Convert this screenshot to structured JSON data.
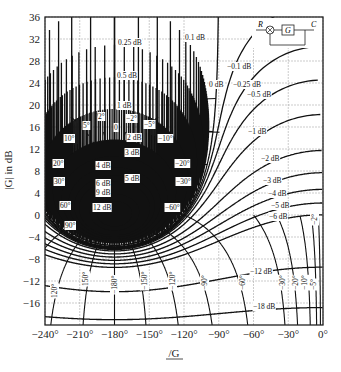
{
  "chart_data": {
    "type": "line",
    "xlabel": "/G",
    "ylabel": "|G| in dB",
    "xlim": [
      -240,
      0
    ],
    "ylim": [
      -20,
      36
    ],
    "x_ticks": [
      -240,
      -210,
      -180,
      -150,
      -120,
      -90,
      -60,
      -30,
      0
    ],
    "x_tick_labels": [
      "−240°",
      "−210°",
      "−180°",
      "−150°",
      "−120°",
      "−90°",
      "−60°",
      "−30°",
      "0°"
    ],
    "y_ticks": [
      -16,
      -12,
      -8,
      -4,
      0,
      4,
      8,
      12,
      16,
      20,
      24,
      28,
      32,
      36
    ],
    "y_tick_labels": [
      "−16",
      "−12",
      "−8",
      "−4",
      "0",
      "4",
      "8",
      "12",
      "16",
      "20",
      "24",
      "28",
      "32",
      "36"
    ],
    "grid": true,
    "series": [
      {
        "name": "M contours (closed-loop magnitude, dB)",
        "values": [
          0.1,
          0.25,
          0.5,
          1,
          2,
          3,
          4,
          5,
          6,
          9,
          12,
          -0.1,
          -0.25,
          -0.5,
          -1,
          -2,
          -3,
          -4,
          -5,
          -6,
          -12,
          -18
        ]
      },
      {
        "name": "N contours (closed-loop phase, deg)",
        "values": [
          -2,
          -5,
          -10,
          -20,
          -30,
          -60,
          -90,
          -120,
          -150,
          -180,
          -210,
          -240,
          -270,
          -300,
          -330,
          -355,
          -358
        ]
      }
    ],
    "m_labels": [
      {
        "text": "0.1 dB",
        "x": 185,
        "y": 40
      },
      {
        "text": "0.25 dB",
        "x": 118,
        "y": 45
      },
      {
        "text": "0.5 dB",
        "x": 117,
        "y": 78
      },
      {
        "text": "1 dB",
        "x": 117,
        "y": 108
      },
      {
        "text": "2 dB",
        "x": 127,
        "y": 140
      },
      {
        "text": "3 dB",
        "x": 125,
        "y": 155
      },
      {
        "text": "4 dB",
        "x": 96,
        "y": 168
      },
      {
        "text": "5 dB",
        "x": 125,
        "y": 181
      },
      {
        "text": "6 dB",
        "x": 96,
        "y": 186
      },
      {
        "text": "9 dB",
        "x": 96,
        "y": 195
      },
      {
        "text": "12 dB",
        "x": 93,
        "y": 210
      },
      {
        "text": "−0.1 dB",
        "x": 227,
        "y": 69
      },
      {
        "text": "0 dB",
        "x": 209,
        "y": 87
      },
      {
        "text": "−0.25 dB",
        "x": 233,
        "y": 87
      },
      {
        "text": "−0.5 dB",
        "x": 247,
        "y": 97
      },
      {
        "text": "−1 dB",
        "x": 248,
        "y": 134
      },
      {
        "text": "−2 dB",
        "x": 261,
        "y": 161
      },
      {
        "text": "−3 dB",
        "x": 263,
        "y": 183
      },
      {
        "text": "−4 dB",
        "x": 268,
        "y": 196
      },
      {
        "text": "−5 dB",
        "x": 271,
        "y": 208
      },
      {
        "text": "−6 dB",
        "x": 269,
        "y": 219
      },
      {
        "text": "−12 dB",
        "x": 250,
        "y": 274
      },
      {
        "text": "−18 dB",
        "x": 253,
        "y": 309
      }
    ],
    "n_labels": [
      {
        "text": "0",
        "x": 114,
        "y": 130
      },
      {
        "text": "2°",
        "x": 98,
        "y": 119
      },
      {
        "text": "−2°",
        "x": 126,
        "y": 121
      },
      {
        "text": "5°",
        "x": 83,
        "y": 128
      },
      {
        "text": "−5°",
        "x": 144,
        "y": 127
      },
      {
        "text": "10°",
        "x": 64,
        "y": 141
      },
      {
        "text": "−10°",
        "x": 158,
        "y": 141
      },
      {
        "text": "20°",
        "x": 53,
        "y": 166
      },
      {
        "text": "−20°",
        "x": 175,
        "y": 166
      },
      {
        "text": "30°",
        "x": 54,
        "y": 184
      },
      {
        "text": "−30°",
        "x": 176,
        "y": 184
      },
      {
        "text": "60°",
        "x": 60,
        "y": 208
      },
      {
        "text": "−60°",
        "x": 165,
        "y": 210
      },
      {
        "text": "90°",
        "x": 65,
        "y": 228
      },
      {
        "text": "120°",
        "x": 57,
        "y": 298,
        "rot": -90
      },
      {
        "text": "150°",
        "x": 88,
        "y": 286,
        "rot": -90
      },
      {
        "text": "−180°",
        "x": 117,
        "y": 294,
        "rot": -90
      },
      {
        "text": "−150°",
        "x": 147,
        "y": 290,
        "rot": -90
      },
      {
        "text": "−120°",
        "x": 175,
        "y": 290,
        "rot": -90
      },
      {
        "text": "−90°",
        "x": 207,
        "y": 290,
        "rot": -90
      },
      {
        "text": "−60°",
        "x": 245,
        "y": 290,
        "rot": -90
      },
      {
        "text": "−30°",
        "x": 285,
        "y": 290,
        "rot": -90
      },
      {
        "text": "−20°",
        "x": 298,
        "y": 290,
        "rot": -90
      },
      {
        "text": "−10°",
        "x": 307,
        "y": 290,
        "rot": -90
      },
      {
        "text": "−5°",
        "x": 316,
        "y": 290,
        "rot": -90
      },
      {
        "text": "−2°",
        "x": 317,
        "y": 225,
        "rot": -90
      }
    ]
  },
  "inset": {
    "input_label": "R",
    "block_label": "G",
    "output_label": "C"
  }
}
